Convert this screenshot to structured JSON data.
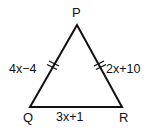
{
  "diagram": {
    "type": "isosceles-triangle",
    "stroke_color": "#111111",
    "background": "#ffffff",
    "vertices": {
      "P": {
        "label": "P",
        "x": 77,
        "y": 25
      },
      "Q": {
        "label": "Q",
        "x": 30,
        "y": 107
      },
      "R": {
        "label": "R",
        "x": 122,
        "y": 107
      }
    },
    "sides": {
      "PQ": {
        "label": "4x−4",
        "congruence_marks": 2
      },
      "PR": {
        "label": "2x+10",
        "congruence_marks": 2
      },
      "QR": {
        "label": "3x+1",
        "congruence_marks": 0
      }
    }
  }
}
